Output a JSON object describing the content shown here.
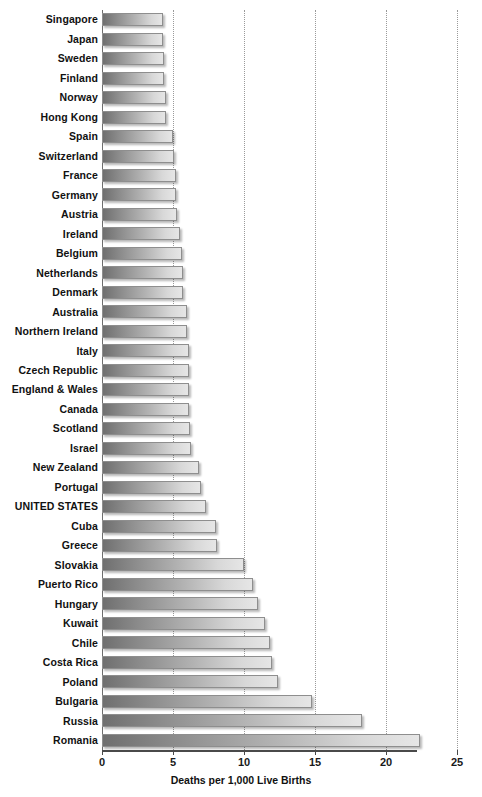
{
  "chart_data": {
    "type": "bar",
    "orientation": "horizontal",
    "title": "",
    "xlabel": "Deaths per 1,000 Live Births",
    "ylabel": "",
    "xlim": [
      0,
      25
    ],
    "xticks": [
      0,
      5,
      10,
      15,
      20,
      25
    ],
    "xtick_labels": [
      "0",
      "5",
      "10",
      "15",
      "20",
      "25"
    ],
    "grid": true,
    "grid_axis": "x",
    "grid_style": "dotted",
    "legend": false,
    "highlight_category": "UNITED STATES",
    "bar_fill": "gradient-gray",
    "bar_border_color": "#8e8e8e",
    "categories": [
      "Singapore",
      "Japan",
      "Sweden",
      "Finland",
      "Norway",
      "Hong Kong",
      "Spain",
      "Switzerland",
      "France",
      "Germany",
      "Austria",
      "Ireland",
      "Belgium",
      "Netherlands",
      "Denmark",
      "Australia",
      "Northern Ireland",
      "Italy",
      "Czech Republic",
      "England & Wales",
      "Canada",
      "Scotland",
      "Israel",
      "New Zealand",
      "Portugal",
      "UNITED STATES",
      "Cuba",
      "Greece",
      "Slovakia",
      "Puerto Rico",
      "Hungary",
      "Kuwait",
      "Chile",
      "Costa Rica",
      "Poland",
      "Bulgaria",
      "Russia",
      "Romania"
    ],
    "values": [
      4.3,
      4.3,
      4.4,
      4.4,
      4.5,
      4.5,
      5.0,
      5.1,
      5.2,
      5.2,
      5.3,
      5.5,
      5.6,
      5.7,
      5.7,
      6.0,
      6.0,
      6.1,
      6.1,
      6.1,
      6.1,
      6.2,
      6.3,
      6.8,
      7.0,
      7.3,
      8.0,
      8.1,
      10.0,
      10.6,
      11.0,
      11.5,
      11.8,
      12.0,
      12.4,
      14.8,
      18.3,
      22.4
    ]
  }
}
